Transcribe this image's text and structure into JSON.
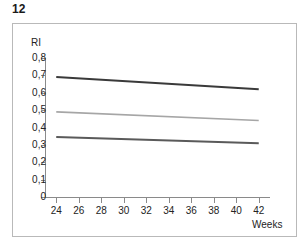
{
  "figure": {
    "number": "12",
    "y_axis_title": "RI",
    "x_axis_title": "Weeks"
  },
  "chart_data": {
    "type": "line",
    "title": "12",
    "xlabel": "Weeks",
    "ylabel": "RI",
    "xlim": [
      23,
      43
    ],
    "ylim": [
      0,
      0.8
    ],
    "grid": false,
    "legend": "none",
    "x_ticks": [
      "24",
      "26",
      "28",
      "30",
      "32",
      "34",
      "36",
      "38",
      "40",
      "42"
    ],
    "x_tick_values": [
      24,
      26,
      28,
      30,
      32,
      34,
      36,
      38,
      40,
      42
    ],
    "y_ticks": [
      "0",
      "0,1",
      "0,2",
      "0,3",
      "0,4",
      "0,5",
      "0,6",
      "0,7",
      "0,8"
    ],
    "y_tick_values": [
      0,
      0.1,
      0.2,
      0.3,
      0.4,
      0.5,
      0.6,
      0.7,
      0.8
    ],
    "decimal_separator": ",",
    "x": [
      24,
      42
    ],
    "series": [
      {
        "name": "upper-line",
        "values": [
          0.69,
          0.62
        ],
        "color": "#3a3a3a",
        "width": 2.0
      },
      {
        "name": "middle-line",
        "values": [
          0.49,
          0.44
        ],
        "color": "#a6a6a6",
        "width": 1.6
      },
      {
        "name": "lower-line",
        "values": [
          0.345,
          0.31
        ],
        "color": "#5a5a5a",
        "width": 2.0
      }
    ]
  },
  "colors": {
    "frame": "#b9b9b9",
    "axis": "#8a8a8a",
    "text": "#232323",
    "background": "#ffffff"
  }
}
